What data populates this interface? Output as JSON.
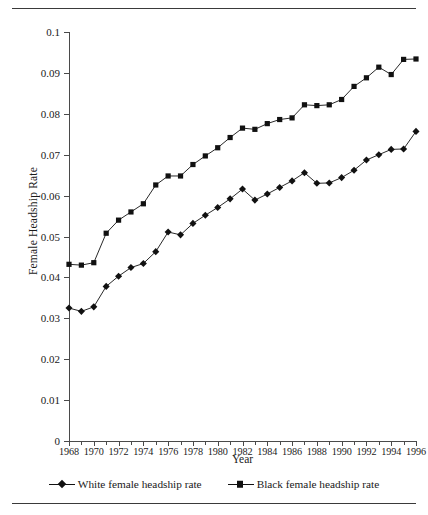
{
  "chart_data": {
    "type": "line",
    "title": "",
    "xlabel": "Year",
    "ylabel": "Female Headship Rate",
    "xlim": [
      1968,
      1996
    ],
    "ylim": [
      0,
      0.1
    ],
    "grid": false,
    "legend_position": "bottom",
    "x": [
      1968,
      1969,
      1970,
      1971,
      1972,
      1973,
      1974,
      1975,
      1976,
      1977,
      1978,
      1979,
      1980,
      1981,
      1982,
      1983,
      1984,
      1985,
      1986,
      1987,
      1988,
      1989,
      1990,
      1991,
      1992,
      1993,
      1994,
      1995,
      1996
    ],
    "y_ticks": [
      0,
      0.01,
      0.02,
      0.03,
      0.04,
      0.05,
      0.06,
      0.07,
      0.08,
      0.09,
      0.1
    ],
    "y_tick_labels": [
      "0",
      "0.01",
      "0.02",
      "0.03",
      "0.04",
      "0.05",
      "0.06",
      "0.07",
      "0.08",
      "0.09",
      "0.1"
    ],
    "x_tick_labels": [
      "1968",
      "1970",
      "1972",
      "1974",
      "1976",
      "1978",
      "1980",
      "1982",
      "1984",
      "1986",
      "1988",
      "1990",
      "1992",
      "1994",
      "1996"
    ],
    "x_major_ticks": [
      1968,
      1970,
      1972,
      1974,
      1976,
      1978,
      1980,
      1982,
      1984,
      1986,
      1988,
      1990,
      1992,
      1994,
      1996
    ],
    "series": [
      {
        "name": "White female headship rate",
        "marker": "diamond",
        "color": "#111111",
        "values": [
          0.0325,
          0.0317,
          0.0328,
          0.0378,
          0.0403,
          0.0424,
          0.0434,
          0.0463,
          0.0511,
          0.0504,
          0.0532,
          0.0552,
          0.0571,
          0.0592,
          0.0616,
          0.0589,
          0.0604,
          0.062,
          0.0636,
          0.0656,
          0.063,
          0.0631,
          0.0644,
          0.0662,
          0.0687,
          0.07,
          0.0713,
          0.0714,
          0.0757
        ]
      },
      {
        "name": "Black female headship rate",
        "marker": "square",
        "color": "#111111",
        "values": [
          0.0432,
          0.043,
          0.0436,
          0.0508,
          0.054,
          0.056,
          0.058,
          0.0626,
          0.0648,
          0.0648,
          0.0676,
          0.0697,
          0.0717,
          0.0742,
          0.0765,
          0.0762,
          0.0776,
          0.0786,
          0.079,
          0.0822,
          0.082,
          0.0822,
          0.0835,
          0.0867,
          0.0888,
          0.0914,
          0.0896,
          0.0933,
          0.0934
        ]
      }
    ]
  },
  "axes": {
    "y_title": "Female Headship Rate",
    "x_title": "Year"
  },
  "legend": {
    "entries": [
      {
        "label": "White female headship rate",
        "marker": "diamond"
      },
      {
        "label": "Black female headship rate",
        "marker": "square"
      }
    ]
  }
}
